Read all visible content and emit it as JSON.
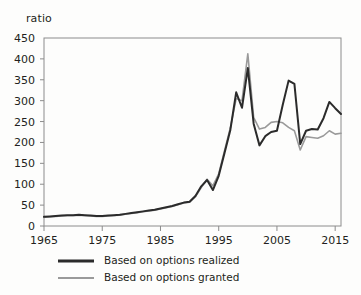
{
  "chart_data": {
    "type": "line",
    "title": "",
    "xlabel": "",
    "ylabel": "ratio",
    "xlim": [
      1965,
      2016
    ],
    "ylim": [
      0,
      450
    ],
    "grid": false,
    "legend_position": "bottom-left",
    "xticks": [
      "1965",
      "1975",
      "1985",
      "1995",
      "2005",
      "2015"
    ],
    "xtick_values": [
      1965,
      1975,
      1985,
      1995,
      2005,
      2015
    ],
    "yticks": [
      "0",
      "50",
      "100",
      "150",
      "200",
      "250",
      "300",
      "350",
      "400",
      "450"
    ],
    "ytick_values": [
      0,
      50,
      100,
      150,
      200,
      250,
      300,
      350,
      400,
      450
    ],
    "x": [
      1965,
      1966,
      1967,
      1968,
      1969,
      1970,
      1971,
      1972,
      1973,
      1974,
      1975,
      1976,
      1977,
      1978,
      1979,
      1980,
      1981,
      1982,
      1983,
      1984,
      1985,
      1986,
      1987,
      1988,
      1989,
      1990,
      1991,
      1992,
      1993,
      1994,
      1995,
      1996,
      1997,
      1998,
      1999,
      2000,
      2001,
      2002,
      2003,
      2004,
      2005,
      2006,
      2007,
      2008,
      2009,
      2010,
      2011,
      2012,
      2013,
      2014,
      2015,
      2016
    ],
    "series": [
      {
        "name": "Based on options realized",
        "color": "#2b2b2b",
        "width": 2.0,
        "values": [
          22,
          23,
          24,
          25,
          26,
          26,
          27,
          26,
          25,
          24,
          24,
          25,
          26,
          27,
          29,
          31,
          33,
          35,
          37,
          39,
          42,
          45,
          48,
          52,
          56,
          58,
          72,
          95,
          110,
          86,
          120,
          175,
          230,
          320,
          283,
          378,
          245,
          193,
          215,
          225,
          228,
          290,
          348,
          340,
          196,
          228,
          232,
          231,
          258,
          297,
          282,
          268
        ]
      },
      {
        "name": "Based on options granted",
        "color": "#9a9a9a",
        "width": 1.6,
        "values": [
          21,
          22,
          23,
          24,
          25,
          25,
          26,
          25,
          24,
          23,
          23,
          24,
          25,
          26,
          28,
          30,
          32,
          34,
          36,
          38,
          41,
          44,
          47,
          51,
          55,
          57,
          70,
          92,
          112,
          96,
          125,
          180,
          235,
          305,
          300,
          412,
          260,
          232,
          236,
          248,
          250,
          247,
          236,
          228,
          182,
          214,
          212,
          210,
          216,
          228,
          220,
          222
        ]
      }
    ]
  },
  "legend": {
    "items": [
      {
        "label": "Based on options realized",
        "color": "#2b2b2b"
      },
      {
        "label": "Based on options granted",
        "color": "#9a9a9a"
      }
    ]
  },
  "axis": {
    "y_title": "ratio"
  }
}
